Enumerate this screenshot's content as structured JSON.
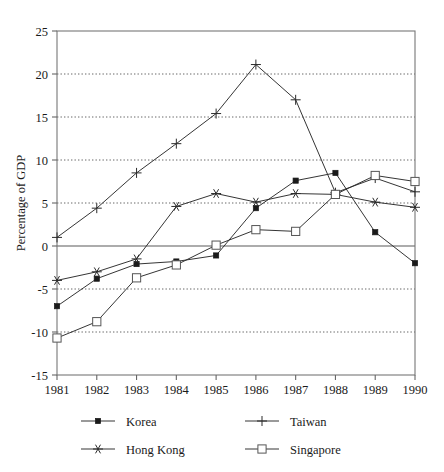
{
  "chart_data": {
    "type": "line",
    "title": "",
    "subtitle": "",
    "xlabel": "",
    "ylabel": "Percentage of GDP",
    "x": [
      1981,
      1982,
      1983,
      1984,
      1985,
      1986,
      1987,
      1988,
      1989,
      1990
    ],
    "categories": [
      "1981",
      "1982",
      "1983",
      "1984",
      "1985",
      "1986",
      "1987",
      "1988",
      "1989",
      "1990"
    ],
    "xtick_labels": [
      "1981",
      "1982",
      "1983",
      "1984",
      "1985",
      "1986",
      "1987",
      "1988",
      "1989",
      "1990"
    ],
    "ytick_labels": [
      "25",
      "20",
      "15",
      "10",
      "5",
      "0",
      "-5",
      "-10",
      "-15"
    ],
    "yticks": [
      25,
      20,
      15,
      10,
      5,
      0,
      -5,
      -10,
      -15
    ],
    "ylim": [
      -15,
      25
    ],
    "xlim": [
      1981,
      1990
    ],
    "grid": "horizontal-dotted",
    "gridlines_at": [
      20,
      15,
      10,
      5,
      -5,
      -10
    ],
    "zero_line": 0,
    "legend_position": "bottom",
    "series": [
      {
        "name": "Korea",
        "marker": "filled-square",
        "values": [
          -7.0,
          -3.8,
          -2.1,
          -1.8,
          -1.1,
          4.4,
          7.6,
          8.5,
          1.6,
          -2.0
        ]
      },
      {
        "name": "Taiwan",
        "marker": "plus",
        "values": [
          1.0,
          4.4,
          8.5,
          11.9,
          15.4,
          21.1,
          17.0,
          6.2,
          7.9,
          6.3
        ]
      },
      {
        "name": "Hong Kong",
        "marker": "asterisk",
        "values": [
          -4.0,
          -3.0,
          -1.5,
          4.6,
          6.1,
          5.1,
          6.1,
          6.0,
          5.1,
          4.5
        ]
      },
      {
        "name": "Singapore",
        "marker": "open-square",
        "values": [
          -10.7,
          -8.8,
          -3.7,
          -2.2,
          0.1,
          1.9,
          1.7,
          6.0,
          8.2,
          7.5
        ]
      }
    ],
    "colors": {
      "line": "#2a2a2a",
      "frame": "#777777",
      "grid": "#555555",
      "zero": "#5a5a5a",
      "background": "#ffffff"
    }
  },
  "legend": {
    "entries": [
      {
        "label": "Korea",
        "marker": "filled-square"
      },
      {
        "label": "Taiwan",
        "marker": "plus"
      },
      {
        "label": "Hong Kong",
        "marker": "asterisk"
      },
      {
        "label": "Singapore",
        "marker": "open-square"
      }
    ]
  }
}
